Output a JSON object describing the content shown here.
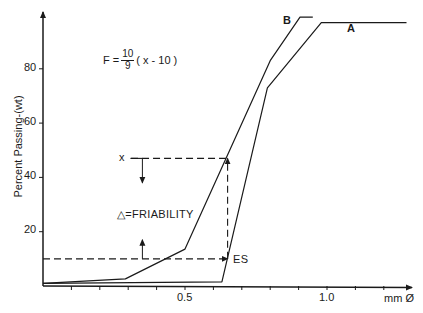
{
  "chart_data": {
    "type": "line",
    "title": "",
    "xlabel": "mm Ø",
    "ylabel": "Percent Passing-(wt)",
    "xlim": [
      0,
      1.3
    ],
    "ylim": [
      0,
      100
    ],
    "grid": false,
    "legend": "none (curves labeled inline)",
    "x_ticks": [
      0.1,
      0.2,
      0.3,
      0.4,
      0.5,
      0.6,
      0.7,
      0.8,
      0.9,
      1.0,
      1.1,
      1.2
    ],
    "x_tick_labels": [
      {
        "value": 0.5,
        "label": "0.5"
      },
      {
        "value": 1.0,
        "label": "1.0"
      }
    ],
    "y_ticks": [
      20,
      40,
      60,
      80
    ],
    "y_tick_labels": [
      "20",
      "40",
      "60",
      "80"
    ],
    "series": [
      {
        "name": "A",
        "points": [
          [
            0.0,
            1
          ],
          [
            0.63,
            1.5
          ],
          [
            0.79,
            73
          ],
          [
            0.98,
            97
          ],
          [
            1.28,
            97
          ]
        ]
      },
      {
        "name": "B",
        "points": [
          [
            0.0,
            1
          ],
          [
            0.29,
            2.6
          ],
          [
            0.5,
            13.6
          ],
          [
            0.8,
            83
          ],
          [
            0.905,
            99
          ],
          [
            0.95,
            99
          ]
        ]
      }
    ],
    "annotations": [
      {
        "type": "formula",
        "text": "F = 10/9 ( x - 10 )",
        "numerator": "10",
        "denominator": "9",
        "prefix": "F =",
        "suffix": "( x - 10 )"
      },
      {
        "type": "label",
        "text": "x",
        "y": 47
      },
      {
        "type": "label",
        "text": "Δ=FRIABILITY"
      },
      {
        "type": "label",
        "text": "ES",
        "y": 10
      },
      {
        "type": "dashed-line",
        "from": [
          0.0,
          10
        ],
        "to": [
          0.65,
          10
        ],
        "arrow": "end"
      },
      {
        "type": "dashed-line",
        "from": [
          0.31,
          47
        ],
        "to": [
          0.65,
          47
        ]
      },
      {
        "type": "dashed-line",
        "from": [
          0.65,
          10
        ],
        "to": [
          0.65,
          47
        ],
        "arrow": "end"
      },
      {
        "type": "arrow",
        "direction": "down",
        "x": 0.35,
        "from_y": 47,
        "to_y": 38
      },
      {
        "type": "arrow",
        "direction": "up",
        "x": 0.35,
        "from_y": 10,
        "to_y": 17
      }
    ]
  },
  "labels": {
    "ylabel": "Percent Passing-(wt)",
    "xlabel": "mm Ø",
    "tick_05": "0.5",
    "tick_10": "1.0",
    "y20": "20",
    "y40": "40",
    "y60": "60",
    "y80": "80",
    "curve_a": "A",
    "curve_b": "B",
    "formula_prefix": "F =",
    "formula_num": "10",
    "formula_den": "9",
    "formula_suffix": "( x - 10 )",
    "x_marker": "x",
    "friability": "△=FRIABILITY",
    "es": "ES"
  },
  "style": {
    "ink": "#1a1a1a",
    "background": "#ffffff"
  }
}
